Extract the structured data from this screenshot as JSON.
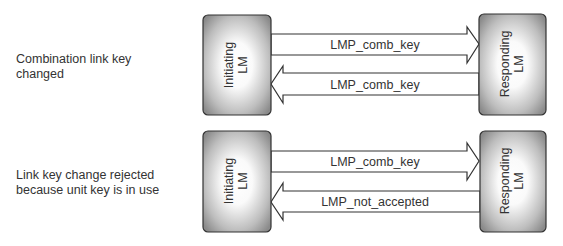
{
  "diagram": {
    "type": "sequence",
    "colors": {
      "box_edge": "#7a7a7a",
      "box_center": "#ffffff",
      "box_border": "#333333",
      "arrow_stroke": "#333333",
      "text": "#333333"
    },
    "scenarios": [
      {
        "label_lines": [
          "Combination link key",
          "changed"
        ],
        "initiator": {
          "line1": "Initiating",
          "line2": "LM"
        },
        "responder": {
          "line1": "Responding",
          "line2": "LM"
        },
        "messages": [
          {
            "label": "LMP_comb_key",
            "direction": "initiator-to-responder"
          },
          {
            "label": "LMP_comb_key",
            "direction": "responder-to-initiator"
          }
        ]
      },
      {
        "label_lines": [
          "Link key change rejected",
          "because unit key is in use"
        ],
        "initiator": {
          "line1": "Initiating",
          "line2": "LM"
        },
        "responder": {
          "line1": "Responding",
          "line2": "LM"
        },
        "messages": [
          {
            "label": "LMP_comb_key",
            "direction": "initiator-to-responder"
          },
          {
            "label": "LMP_not_accepted",
            "direction": "responder-to-initiator"
          }
        ]
      }
    ]
  }
}
